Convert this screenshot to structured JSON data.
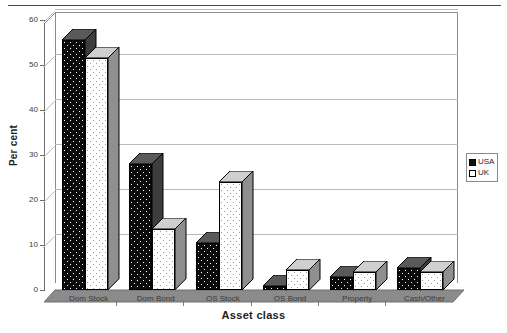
{
  "chart_data": {
    "type": "bar",
    "title": "",
    "subtitle": "",
    "xlabel": "Asset class",
    "ylabel": "Per cent",
    "categories": [
      "Dom Stock",
      "Dom Bond",
      "OS Stock",
      "OS Bond",
      "Property",
      "Cash/Other"
    ],
    "series": [
      {
        "name": "USA",
        "values": [
          55.5,
          28.0,
          10.5,
          1.0,
          3.0,
          5.0
        ],
        "color": "#111111",
        "pattern": "black-dotted"
      },
      {
        "name": "UK",
        "values": [
          51.5,
          13.5,
          24.0,
          4.5,
          4.0,
          4.0
        ],
        "color": "#ffffff",
        "pattern": "white-dotted"
      }
    ],
    "ylim": [
      0,
      60
    ],
    "yticks": [
      0,
      10,
      20,
      30,
      40,
      50,
      60
    ],
    "ytick_labels": [
      "0",
      "10",
      "20",
      "30",
      "40",
      "50",
      "60"
    ],
    "grid": true,
    "grid_axis": "y",
    "legend": true,
    "legend_position": "right",
    "three_d": true,
    "style": "excel-3d-clustered-column"
  },
  "axes": {
    "y_title": "Per cent",
    "x_title": "Asset class",
    "y_ticks": [
      "60",
      "50",
      "40",
      "30",
      "20",
      "10",
      "0"
    ],
    "x_ticks": [
      "Dom Stock",
      "Dom Bond",
      "OS Stock",
      "OS Bond",
      "Property",
      "Cash/Other"
    ]
  },
  "legend": {
    "items": [
      {
        "label": "USA",
        "swatch": "black-square-icon"
      },
      {
        "label": "UK",
        "swatch": "white-square-icon"
      }
    ]
  }
}
